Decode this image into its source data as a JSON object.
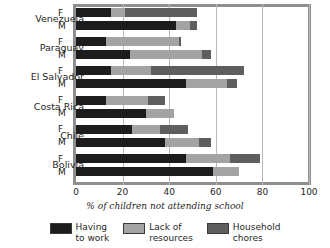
{
  "chart_data": {
    "type": "bar",
    "orientation": "horizontal",
    "stacked": true,
    "title": "",
    "xlabel": "% of children not attending school",
    "ylabel": "",
    "xlim": [
      0,
      100
    ],
    "xticks": [
      0,
      20,
      40,
      60,
      80,
      100
    ],
    "xtick_labels": [
      "0",
      "20",
      "40",
      "60",
      "80",
      "100"
    ],
    "grid": true,
    "legend_position": "bottom",
    "series": [
      {
        "name": "Having to work",
        "key": "work",
        "color": "#1c1c1c"
      },
      {
        "name": "Lack of resources",
        "key": "res",
        "color": "#a3a3a3"
      },
      {
        "name": "Household chores",
        "key": "chores",
        "color": "#5e5e5e"
      }
    ],
    "categories": [
      "Venezuela",
      "Paraguay",
      "El Salvador",
      "Costa Rica",
      "Chile",
      "Bolivia"
    ],
    "subcategories": [
      "F",
      "M"
    ],
    "rows": [
      {
        "country": "Venezuela",
        "sex": "F",
        "work": 15,
        "res": 6,
        "chores": 31,
        "total": 52
      },
      {
        "country": "Venezuela",
        "sex": "M",
        "work": 43,
        "res": 6,
        "chores": 3,
        "total": 52
      },
      {
        "country": "Paraguay",
        "sex": "F",
        "work": 13,
        "res": 31,
        "chores": 1,
        "total": 45
      },
      {
        "country": "Paraguay",
        "sex": "M",
        "work": 23,
        "res": 31,
        "chores": 4,
        "total": 58
      },
      {
        "country": "El Salvador",
        "sex": "F",
        "work": 15,
        "res": 17,
        "chores": 40,
        "total": 72
      },
      {
        "country": "El Salvador",
        "sex": "M",
        "work": 47,
        "res": 18,
        "chores": 4,
        "total": 69
      },
      {
        "country": "Costa Rica",
        "sex": "F",
        "work": 13,
        "res": 18,
        "chores": 7,
        "total": 38
      },
      {
        "country": "Costa Rica",
        "sex": "M",
        "work": 30,
        "res": 12,
        "chores": 0,
        "total": 42
      },
      {
        "country": "Chile",
        "sex": "F",
        "work": 24,
        "res": 12,
        "chores": 12,
        "total": 48
      },
      {
        "country": "Chile",
        "sex": "M",
        "work": 38,
        "res": 15,
        "chores": 5,
        "total": 58
      },
      {
        "country": "Bolivia",
        "sex": "F",
        "work": 47,
        "res": 19,
        "chores": 13,
        "total": 79
      },
      {
        "country": "Bolivia",
        "sex": "M",
        "work": 59,
        "res": 11,
        "chores": 0,
        "total": 70
      }
    ]
  },
  "legend": {
    "items": [
      {
        "label": "Having\nto work"
      },
      {
        "label": "Lack of\nresources"
      },
      {
        "label": "Household\nchores"
      }
    ]
  }
}
